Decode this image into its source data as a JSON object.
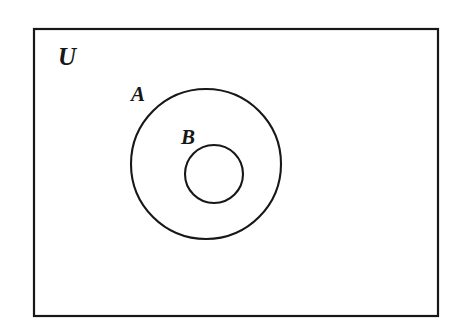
{
  "figure": {
    "type": "venn-diagram",
    "background_color": "#ffffff",
    "stroke_color": "#171717",
    "fill_color": "none"
  },
  "universe": {
    "label": "U",
    "shape": "rectangle",
    "x": 34,
    "y": 29,
    "width": 404,
    "height": 287,
    "stroke_width": 2.2,
    "label_x": 58,
    "label_y": 65
  },
  "sets": [
    {
      "name": "set-a",
      "label": "A",
      "shape": "circle",
      "cx": 206,
      "cy": 164,
      "r": 75,
      "stroke_width": 2.1,
      "label_x": 131,
      "label_y": 101
    },
    {
      "name": "set-b",
      "label": "B",
      "shape": "circle",
      "cx": 214,
      "cy": 174,
      "r": 29,
      "stroke_width": 2.1,
      "label_x": 181,
      "label_y": 144
    }
  ]
}
